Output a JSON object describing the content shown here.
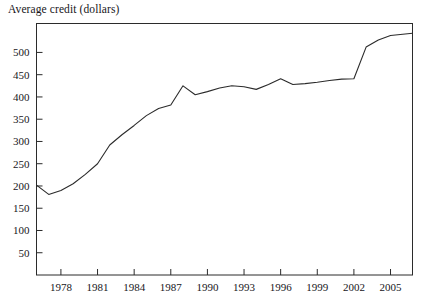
{
  "chart_data": {
    "type": "line",
    "title": "Average credit (dollars)",
    "xlabel": "",
    "ylabel": "",
    "grid": false,
    "legend": "none",
    "xlim": [
      1976,
      2006.8
    ],
    "ylim": [
      0,
      565
    ],
    "ytick_values": [
      50,
      100,
      150,
      200,
      250,
      300,
      350,
      400,
      450,
      500
    ],
    "ytick_labels": [
      "50",
      "100",
      "150",
      "200",
      "250",
      "300",
      "350",
      "400",
      "450",
      "500"
    ],
    "xtick_values": [
      1978,
      1981,
      1984,
      1987,
      1990,
      1993,
      1996,
      1999,
      2002,
      2005
    ],
    "xtick_labels": [
      "1978",
      "1981",
      "1984",
      "1987",
      "1990",
      "1993",
      "1996",
      "1999",
      "2002",
      "2005"
    ],
    "series": [
      {
        "name": "Average credit (dollars)",
        "color": "#2b2b2b",
        "x": [
          1976,
          1977,
          1978,
          1979,
          1980,
          1981,
          1982,
          1983,
          1984,
          1985,
          1986,
          1987,
          1988,
          1989,
          1990,
          1991,
          1992,
          1993,
          1994,
          1995,
          1996,
          1997,
          1998,
          1999,
          2000,
          2001,
          2002,
          2003,
          2004,
          2005,
          2006.8
        ],
        "values": [
          202,
          181,
          190,
          205,
          226,
          250,
          292,
          315,
          336,
          358,
          374,
          382,
          425,
          405,
          412,
          420,
          425,
          423,
          417,
          428,
          441,
          428,
          430,
          433,
          437,
          440,
          441,
          512,
          528,
          538,
          543
        ]
      }
    ]
  },
  "axes": {
    "frame_color": "#2b2b2b",
    "background": "#ffffff"
  }
}
